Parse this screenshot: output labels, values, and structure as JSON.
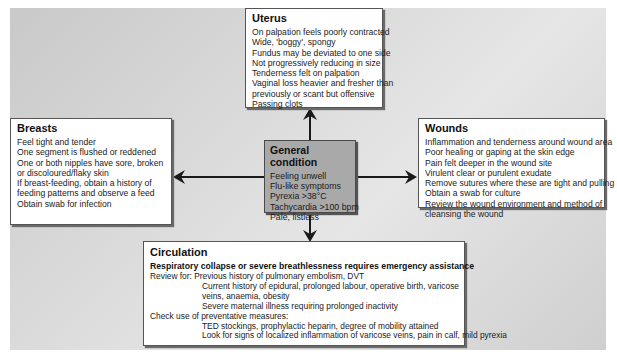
{
  "diagram": {
    "center": {
      "title": "General condition",
      "items": [
        "Feeling unwell",
        "Flu-like symptoms",
        "Pyrexia >38°C",
        "Tachycardia >100 bpm",
        "Pale, listless"
      ]
    },
    "uterus": {
      "title": "Uterus",
      "items": [
        "On palpation feels poorly contracted",
        "Wide, 'boggy', spongy",
        "Fundus may be deviated to one side",
        "Not progressively reducing in size",
        "Tenderness felt on palpation",
        "Vaginal loss heavier and fresher than",
        "previously or scant but offensive",
        "Passing clots"
      ]
    },
    "breasts": {
      "title": "Breasts",
      "items": [
        "Feel tight and tender",
        "One segment is flushed or reddened",
        "One or both nipples have sore, broken",
        "or discoloured/flaky skin",
        "If breast-feeding, obtain a history of",
        "feeding patterns and observe a feed",
        "Obtain swab for infection"
      ]
    },
    "wounds": {
      "title": "Wounds",
      "items": [
        "Inflammation and tenderness around wound area",
        "Poor healing or gaping at the skin edge",
        "Pain felt deeper in the wound site",
        "Virulent clear or purulent exudate",
        "Remove sutures where these are tight and pulling",
        "Obtain a swab for culture",
        "Review the wound environment and method of",
        "cleansing the wound"
      ]
    },
    "circulation": {
      "title": "Circulation",
      "alert": "Respiratory collapse or severe breathlessness requires emergency assistance",
      "items": [
        "Review for: Previous history of pulmonary embolism, DVT",
        "Current history of epidural, prolonged labour, operative birth, varicose",
        "veins, anaemia, obesity",
        "Severe maternal illness requiring prolonged inactivity",
        "Check use of preventative measures:",
        "TED stockings, prophylactic heparin, degree of mobility attained",
        "Look for signs of localized inflammation of varicose veins, pain in calf, mild pyrexia"
      ]
    },
    "colors": {
      "center_fill": "#a9a9a9",
      "box_fill": "#ffffff",
      "background": "#d6d6d6",
      "arrow": "#1a1a1a"
    }
  }
}
